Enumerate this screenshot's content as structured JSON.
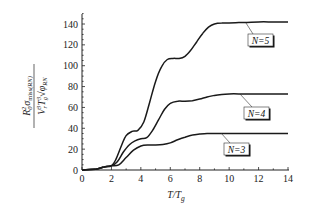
{
  "chart_data": {
    "type": "line",
    "title": "",
    "xlabel": "T/T_g",
    "ylabel": "R0^2 σ_miss(RN) / (V_r^3 T_g^3 √φ_RN)",
    "xlim": [
      0,
      14
    ],
    "ylim": [
      0,
      150
    ],
    "x_ticks": [
      0,
      2,
      4,
      6,
      8,
      10,
      12,
      14
    ],
    "y_ticks": [
      0,
      20,
      40,
      60,
      80,
      100,
      120,
      140
    ],
    "grid": false,
    "legend_position": "inline labels at right",
    "series": [
      {
        "name": "N=5",
        "x": [
          0,
          1,
          1.5,
          2,
          2.3,
          2.7,
          3,
          3.4,
          3.8,
          4.2,
          4.6,
          5,
          5.4,
          5.8,
          6.2,
          6.6,
          7,
          7.4,
          7.8,
          8.2,
          8.6,
          9,
          9.5,
          10,
          11,
          12,
          13,
          14
        ],
        "y": [
          0,
          1,
          3,
          4,
          10,
          24,
          33,
          37,
          38,
          46,
          65,
          85,
          99,
          106,
          107,
          107,
          109,
          115,
          123,
          131,
          137,
          140,
          141,
          141,
          141.5,
          142,
          142,
          142
        ]
      },
      {
        "name": "N=4",
        "x": [
          0,
          1,
          1.5,
          2,
          2.4,
          2.8,
          3.2,
          3.6,
          4,
          4.4,
          4.8,
          5.2,
          5.6,
          6,
          6.5,
          7,
          7.5,
          8,
          8.5,
          9,
          9.5,
          10,
          11,
          12,
          13,
          14
        ],
        "y": [
          0,
          1,
          3,
          4,
          8,
          17,
          24,
          28,
          30,
          31,
          38,
          48,
          58,
          64,
          66,
          66,
          66.5,
          68,
          70,
          71.5,
          72.5,
          73,
          73,
          73,
          73,
          73
        ]
      },
      {
        "name": "N=3",
        "x": [
          0,
          1,
          1.5,
          2,
          2.5,
          3,
          3.5,
          4,
          4.5,
          5,
          5.5,
          6,
          6.5,
          7,
          7.5,
          8,
          8.5,
          9,
          9.5,
          10,
          11,
          12,
          13,
          14
        ],
        "y": [
          0,
          1,
          3,
          4,
          5,
          12,
          19,
          23,
          24,
          24,
          24.5,
          26,
          29,
          31.5,
          33.5,
          34.5,
          35,
          35,
          35,
          35,
          35,
          35,
          35,
          35
        ]
      }
    ]
  },
  "labels": {
    "xlabel_main": "T/T",
    "xlabel_sub": "g",
    "legend": [
      "N=5",
      "N=4",
      "N=3"
    ],
    "x_ticks": [
      "0",
      "2",
      "4",
      "6",
      "8",
      "10",
      "12",
      "14"
    ],
    "y_ticks": [
      "0",
      "20",
      "40",
      "60",
      "80",
      "100",
      "120",
      "140"
    ]
  }
}
